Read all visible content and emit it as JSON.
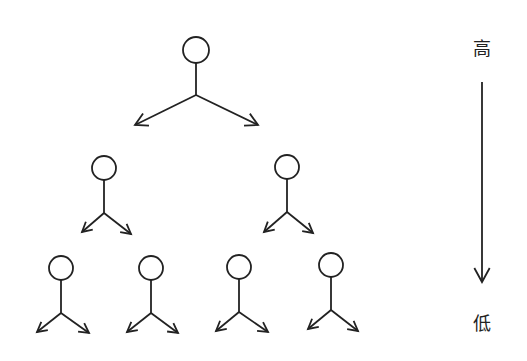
{
  "diagram": {
    "title": "",
    "type": "hierarchy",
    "stroke_color": "#222222",
    "background": "#ffffff",
    "levels": [
      {
        "name": "level-1",
        "nodes": [
          {
            "cx": 196,
            "cy": 50,
            "r": 13,
            "stem_end": 95,
            "arrow_left": [
              135,
              125
            ],
            "arrow_right": [
              258,
              125
            ]
          }
        ]
      },
      {
        "name": "level-2",
        "nodes": [
          {
            "cx": 104,
            "cy": 168,
            "r": 12,
            "stem_end": 213,
            "arrow_left": [
              82,
              232
            ],
            "arrow_right": [
              131,
              234
            ]
          },
          {
            "cx": 287,
            "cy": 167,
            "r": 12,
            "stem_end": 212,
            "arrow_left": [
              264,
              232
            ],
            "arrow_right": [
              313,
              233
            ]
          }
        ]
      },
      {
        "name": "level-3",
        "nodes": [
          {
            "cx": 61,
            "cy": 268,
            "r": 12,
            "stem_end": 313,
            "arrow_left": [
              37,
              332
            ],
            "arrow_right": [
              89,
              333
            ]
          },
          {
            "cx": 151,
            "cy": 268,
            "r": 12,
            "stem_end": 313,
            "arrow_left": [
              127,
              332
            ],
            "arrow_right": [
              178,
              333
            ]
          },
          {
            "cx": 239,
            "cy": 267,
            "r": 12,
            "stem_end": 312,
            "arrow_left": [
              216,
              331
            ],
            "arrow_right": [
              268,
              332
            ]
          },
          {
            "cx": 331,
            "cy": 265,
            "r": 12,
            "stem_end": 310,
            "arrow_left": [
              308,
              329
            ],
            "arrow_right": [
              358,
              331
            ]
          }
        ]
      }
    ],
    "scale": {
      "top_label": "高",
      "bottom_label": "低",
      "arrow_x": 482,
      "arrow_y_start": 82,
      "arrow_y_end": 282,
      "top_label_pos": [
        482,
        47
      ],
      "bottom_label_pos": [
        482,
        322
      ]
    }
  }
}
